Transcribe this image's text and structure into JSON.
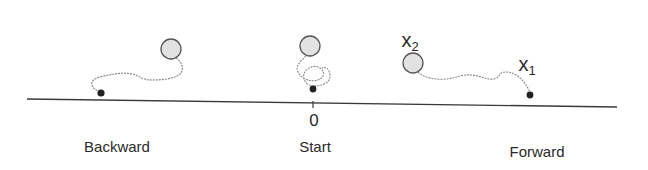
{
  "diagram": {
    "axis": {
      "origin_label": "0",
      "colors": {
        "line": "#3a3a3a",
        "path": "#8a8a8a",
        "circle_fill": "#e2e2e2",
        "circle_stroke": "#555555",
        "dot": "#222222"
      }
    },
    "panels": [
      {
        "id": "backward",
        "label": "Backward"
      },
      {
        "id": "start",
        "label": "Start"
      },
      {
        "id": "forward",
        "label": "Forward"
      }
    ],
    "markers": {
      "x1": {
        "base": "x",
        "sub": "1"
      },
      "x2": {
        "base": "x",
        "sub": "2"
      }
    }
  }
}
